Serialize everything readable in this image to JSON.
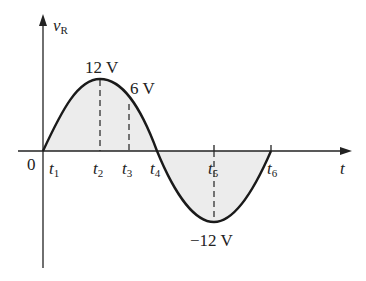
{
  "diagram": {
    "y_axis_label": "v",
    "y_axis_sub": "R",
    "x_axis_label": "t",
    "origin_label": "0",
    "time_marks": [
      {
        "name": "t",
        "sub": "1"
      },
      {
        "name": "t",
        "sub": "2"
      },
      {
        "name": "t",
        "sub": "3"
      },
      {
        "name": "t",
        "sub": "4"
      },
      {
        "name": "t",
        "sub": "5"
      },
      {
        "name": "t",
        "sub": "6"
      }
    ],
    "annotations": {
      "peak": "12 V",
      "mid": "6 V",
      "trough": "−12 V"
    },
    "colors": {
      "curve": "#1a1a1a",
      "fill": "#ececec",
      "axis": "#222222"
    }
  }
}
